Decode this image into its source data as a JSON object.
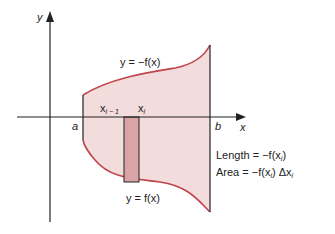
{
  "figure": {
    "axes": {
      "x_label": "x",
      "y_label": "y"
    },
    "bounds": {
      "a": "a",
      "b": "b"
    },
    "curves": {
      "top": "y = −f(x)",
      "bottom": "y = f(x)"
    },
    "strip": {
      "left": "x",
      "left_sub": "i − 1",
      "right": "x",
      "right_sub": "i"
    },
    "annotations": {
      "length": "Length = −f(x",
      "length_sub": "i",
      "length_end": ")",
      "area": "Area = −f(x",
      "area_sub": "i",
      "area_mid": ") Δx",
      "area_sub2": "i"
    },
    "colors": {
      "fill": "#f2dcdc",
      "curve": "#c0444c",
      "strip": "#d9a3a8",
      "axis": "#222222"
    }
  }
}
